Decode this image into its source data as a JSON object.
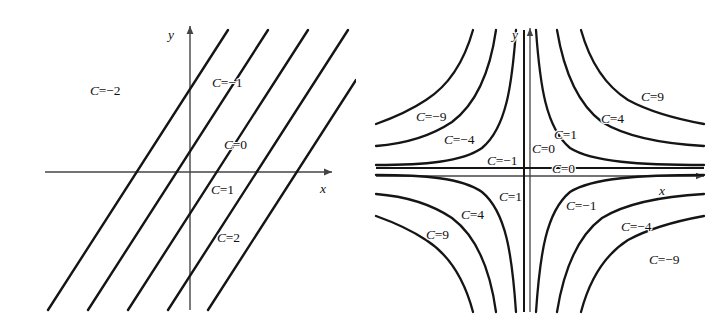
{
  "figure": {
    "background": "#ffffff",
    "stroke": "#111111",
    "axis_stroke": "#444444"
  },
  "chart_data": [
    {
      "type": "line",
      "title": "",
      "subtitle": "",
      "xlabel": "x",
      "ylabel": "y",
      "grid": false,
      "legend_position": "inline-annotations",
      "description": "Level curves of f(x,y) = x - y: a family of parallel straight lines of slope 1, labelled C = -2, -1, 0, 1, 2",
      "axis_style": "arrowed-cartesian-axes-through-origin",
      "xlim": [
        -4.5,
        4.5
      ],
      "ylim": [
        -4.5,
        4.5
      ],
      "level_label_prefix": "C=",
      "series": [
        {
          "name": "C=-2",
          "level": -2,
          "slope": 1,
          "intercept": 2,
          "label": "C=−2",
          "label_x": 90,
          "label_y": 84
        },
        {
          "name": "C=-1",
          "level": -1,
          "slope": 1,
          "intercept": 1,
          "label": "C=−1",
          "label_x": 212,
          "label_y": 76
        },
        {
          "name": "C=0",
          "level": 0,
          "slope": 1,
          "intercept": 0,
          "label": "C=0",
          "label_x": 224,
          "label_y": 138
        },
        {
          "name": "C=1",
          "level": 1,
          "slope": 1,
          "intercept": -1,
          "label": "C=1",
          "label_x": 211,
          "label_y": 183
        },
        {
          "name": "C=2",
          "level": 2,
          "slope": 1,
          "intercept": -2,
          "label": "C=2",
          "label_x": 217,
          "label_y": 231
        }
      ]
    },
    {
      "type": "line",
      "title": "",
      "subtitle": "",
      "xlabel": "x",
      "ylabel": "y",
      "grid": false,
      "legend_position": "inline-annotations",
      "description": "Level curves of f(x,y) = x*y: a family of hyperbolas y = C/x together with the degenerate pair C = 0 (the coordinate axes), labelled C = -9, -4, -1, 0, 1, 4, 9",
      "axis_style": "arrowed-cartesian-axes-through-origin",
      "xlim": [
        -4.5,
        4.5
      ],
      "ylim": [
        -4.5,
        4.5
      ],
      "level_label_prefix": "C=",
      "series": [
        {
          "name": "C=-9-upper-left",
          "level": -9,
          "label": "C=−9",
          "label_x": 60,
          "label_y": 110
        },
        {
          "name": "C=-4-upper-left",
          "level": -4,
          "label": "C=−4",
          "label_x": 88,
          "label_y": 133
        },
        {
          "name": "C=-1-upper-left",
          "level": -1,
          "label": "C=−1",
          "label_x": 131,
          "label_y": 154
        },
        {
          "name": "C=0-vertical",
          "level": 0,
          "label": "C=0",
          "label_x": 176,
          "label_y": 142
        },
        {
          "name": "C=0-horizontal",
          "level": 0,
          "label": "C=0",
          "label_x": 196,
          "label_y": 162
        },
        {
          "name": "C=1-upper-right",
          "level": 1,
          "label": "C=1",
          "label_x": 198,
          "label_y": 128
        },
        {
          "name": "C=4-upper-right",
          "level": 4,
          "label": "C=4",
          "label_x": 245,
          "label_y": 112
        },
        {
          "name": "C=9-upper-right",
          "level": 9,
          "label": "C=9",
          "label_x": 285,
          "label_y": 90
        },
        {
          "name": "C=1-lower-left",
          "level": 1,
          "label": "C=1",
          "label_x": 143,
          "label_y": 190
        },
        {
          "name": "C=4-lower-left",
          "level": 4,
          "label": "C=4",
          "label_x": 105,
          "label_y": 208
        },
        {
          "name": "C=9-lower-left",
          "level": 9,
          "label": "C=9",
          "label_x": 70,
          "label_y": 228
        },
        {
          "name": "C=-1-lower-right",
          "level": -1,
          "label": "C=−1",
          "label_x": 210,
          "label_y": 199
        },
        {
          "name": "C=-4-lower-right",
          "level": -4,
          "label": "C=−4",
          "label_x": 265,
          "label_y": 220
        },
        {
          "name": "C=-9-lower-right",
          "level": -9,
          "label": "C=−9",
          "label_x": 293,
          "label_y": 253
        }
      ]
    }
  ],
  "panels": {
    "left": {
      "name": "parallel-lines-level-curves",
      "axis_x_label": "x",
      "axis_y_label": "y",
      "labels": [
        {
          "text": "C=−2",
          "x": 90,
          "y": 84
        },
        {
          "text": "C=−1",
          "x": 212,
          "y": 76
        },
        {
          "text": "C=0",
          "x": 224,
          "y": 138
        },
        {
          "text": "C=1",
          "x": 211,
          "y": 183
        },
        {
          "text": "C=2",
          "x": 217,
          "y": 231
        }
      ]
    },
    "right": {
      "name": "hyperbola-level-curves",
      "axis_x_label": "x",
      "axis_y_label": "y",
      "labels": [
        {
          "text": "C=−9",
          "x": 60,
          "y": 110
        },
        {
          "text": "C=−4",
          "x": 88,
          "y": 133
        },
        {
          "text": "C=−1",
          "x": 131,
          "y": 154
        },
        {
          "text": "C=0",
          "x": 176,
          "y": 142
        },
        {
          "text": "C=0",
          "x": 196,
          "y": 162
        },
        {
          "text": "C=1",
          "x": 198,
          "y": 128
        },
        {
          "text": "C=4",
          "x": 245,
          "y": 112
        },
        {
          "text": "C=9",
          "x": 285,
          "y": 90
        },
        {
          "text": "C=1",
          "x": 143,
          "y": 190
        },
        {
          "text": "C=4",
          "x": 105,
          "y": 208
        },
        {
          "text": "C=9",
          "x": 70,
          "y": 228
        },
        {
          "text": "C=−1",
          "x": 210,
          "y": 199
        },
        {
          "text": "C=−4",
          "x": 265,
          "y": 220
        },
        {
          "text": "C=−9",
          "x": 293,
          "y": 253
        }
      ]
    }
  }
}
